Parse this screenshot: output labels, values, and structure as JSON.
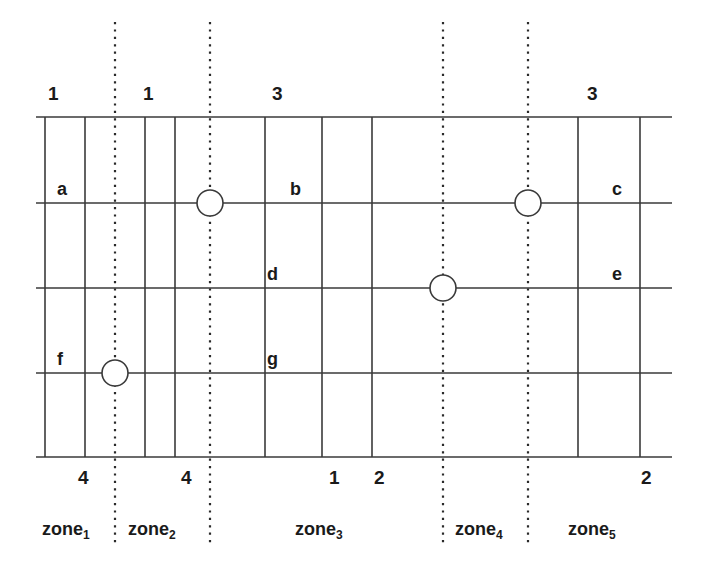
{
  "figure": {
    "kind": "grid-zone-diagram",
    "colors": {
      "ink": "#1a1a1a",
      "grid": "#3a3a3a",
      "background": "#ffffff"
    },
    "top_numbers": [
      {
        "text": "1",
        "x": 48,
        "y": 84
      },
      {
        "text": "1",
        "x": 143,
        "y": 84
      },
      {
        "text": "3",
        "x": 272,
        "y": 84
      },
      {
        "text": "3",
        "x": 587,
        "y": 84
      }
    ],
    "bottom_numbers": [
      {
        "text": "4",
        "x": 78,
        "y": 468
      },
      {
        "text": "4",
        "x": 181,
        "y": 468
      },
      {
        "text": "1",
        "x": 329,
        "y": 468
      },
      {
        "text": "2",
        "x": 374,
        "y": 468
      },
      {
        "text": "2",
        "x": 641,
        "y": 468
      }
    ],
    "cell_letters": [
      {
        "text": "a",
        "x": 57,
        "y": 180
      },
      {
        "text": "b",
        "x": 290,
        "y": 180
      },
      {
        "text": "c",
        "x": 612,
        "y": 180
      },
      {
        "text": "d",
        "x": 267,
        "y": 265
      },
      {
        "text": "e",
        "x": 612,
        "y": 265
      },
      {
        "text": "f",
        "x": 57,
        "y": 350
      },
      {
        "text": "g",
        "x": 267,
        "y": 350
      }
    ],
    "zones": [
      {
        "label": "zone",
        "sub": "1",
        "x": 42,
        "y": 520
      },
      {
        "label": "zone",
        "sub": "2",
        "x": 128,
        "y": 520
      },
      {
        "label": "zone",
        "sub": "3",
        "x": 295,
        "y": 520
      },
      {
        "label": "zone",
        "sub": "4",
        "x": 455,
        "y": 520
      },
      {
        "label": "zone",
        "sub": "5",
        "x": 568,
        "y": 520
      }
    ],
    "grid": {
      "left": 36,
      "right": 672,
      "horizontal_lines_y": [
        117,
        203,
        288,
        373,
        457
      ],
      "solid_vertical_x": [
        45,
        85,
        145,
        175,
        265,
        322,
        372,
        578,
        640
      ],
      "dotted_vertical_x": [
        115,
        210,
        443,
        528
      ],
      "dotted_top_y": 22,
      "dotted_bottom_y": 545
    },
    "nodes": [
      {
        "name": "node-zone1-row3",
        "cx": 115,
        "cy": 373,
        "r": 13
      },
      {
        "name": "node-zone2-row1",
        "cx": 210,
        "cy": 203,
        "r": 13
      },
      {
        "name": "node-zone3-row2",
        "cx": 443,
        "cy": 288,
        "r": 13
      },
      {
        "name": "node-zone4-row1",
        "cx": 528,
        "cy": 203,
        "r": 13
      }
    ]
  }
}
